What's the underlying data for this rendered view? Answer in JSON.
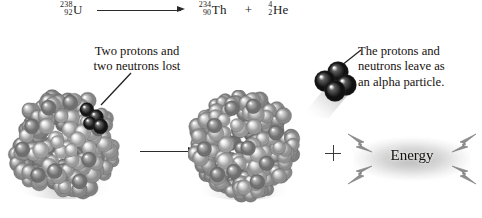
{
  "figure": {
    "background_color": "#ffffff"
  },
  "equation": {
    "reactant": {
      "mass_number": "238",
      "atomic_number": "92",
      "symbol": "U"
    },
    "arrow": "⟶",
    "products": [
      {
        "mass_number": "234",
        "atomic_number": "90",
        "symbol": "Th"
      },
      {
        "mass_number": "4",
        "atomic_number": "2",
        "symbol": "He"
      }
    ],
    "plus": "+"
  },
  "labels": {
    "left_callout": {
      "line1": "Two protons and",
      "line2": "two neutrons lost"
    },
    "right_callout": {
      "line1": "The protons and",
      "line2": "neutrons leave as",
      "line3": "an alpha particle."
    }
  },
  "diagram": {
    "reaction_arrow": "⟶",
    "plus_sign": "+",
    "energy_label": "Energy",
    "parent_nucleus_name": "uranium-238 nucleus",
    "daughter_nucleus_name": "thorium-234 nucleus",
    "alpha_particle_name": "alpha particle"
  },
  "colors": {
    "nucleon_light": "#c9c9c9",
    "nucleon_mid": "#9a9a9a",
    "nucleon_dark": "#3a3a3a",
    "text": "#17120f",
    "line": "#2b2b2b",
    "energy_glow": "#8c8c8c"
  }
}
